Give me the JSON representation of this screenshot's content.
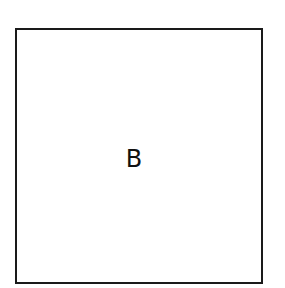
{
  "diagram": {
    "shape": "square",
    "label": "B",
    "colors": {
      "stroke": "#1a1a1a",
      "background": "#ffffff",
      "text": "#111111"
    }
  }
}
